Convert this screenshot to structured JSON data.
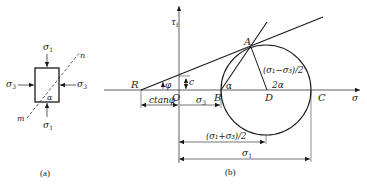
{
  "figure_a": {
    "caption": "(a)",
    "labels": {
      "sigma1_top": "σ",
      "sigma1_top_sub": "1",
      "sigma1_bottom": "σ",
      "sigma1_bottom_sub": "1",
      "sigma3_left": "σ",
      "sigma3_left_sub": "3",
      "sigma3_right": "σ",
      "sigma3_right_sub": "3",
      "plane_n": "n",
      "plane_m": "m",
      "angle": "α"
    }
  },
  "figure_b": {
    "caption": "(b)",
    "axes": {
      "y_label": "τ",
      "y_label_sub": "f",
      "x_label": "σ"
    },
    "points": {
      "R": "R",
      "O": "O",
      "B": "B",
      "A": "A",
      "D": "D",
      "C": "C"
    },
    "angles": {
      "phi": "φ",
      "alpha": "α",
      "two_alpha": "2α"
    },
    "dimensions": {
      "c": "c",
      "ctan_phi": "ctanφ",
      "sigma3": "σ",
      "sigma3_sub": "3",
      "radius": "(σ₁−σ₃)/2",
      "center": "(σ₁+σ₃)/2",
      "sigma1": "σ",
      "sigma1_sub": "1"
    }
  }
}
